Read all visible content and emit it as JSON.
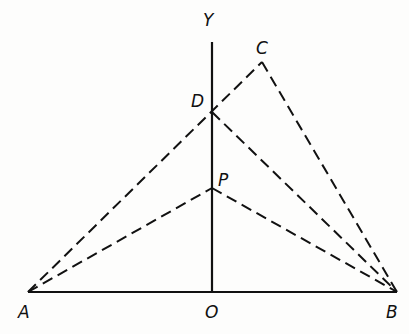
{
  "diagram": {
    "points": {
      "A": {
        "label": "A",
        "x": 28,
        "y": 292,
        "lx": 18,
        "ly": 318
      },
      "B": {
        "label": "B",
        "x": 397,
        "y": 292,
        "lx": 386,
        "ly": 318
      },
      "O": {
        "label": "O",
        "x": 212,
        "y": 292,
        "lx": 205,
        "ly": 318
      },
      "Y": {
        "label": "Y",
        "x": 212,
        "y": 42,
        "lx": 203,
        "ly": 26
      },
      "C": {
        "label": "C",
        "x": 262,
        "y": 62,
        "lx": 256,
        "ly": 54
      },
      "D": {
        "label": "D",
        "x": 212,
        "y": 112,
        "lx": 191,
        "ly": 107
      },
      "P": {
        "label": "P",
        "x": 212,
        "y": 188,
        "lx": 218,
        "ly": 186
      }
    },
    "solid_lines": [
      {
        "from": "A",
        "to": "B"
      },
      {
        "from": "O",
        "to": "Y"
      }
    ],
    "dashed_lines": [
      {
        "from": "A",
        "to": "C"
      },
      {
        "from": "C",
        "to": "B"
      },
      {
        "from": "D",
        "to": "B"
      },
      {
        "from": "A",
        "to": "P"
      },
      {
        "from": "P",
        "to": "B"
      }
    ],
    "colors": {
      "line": "#111111",
      "background": "#fdfdfc"
    }
  }
}
